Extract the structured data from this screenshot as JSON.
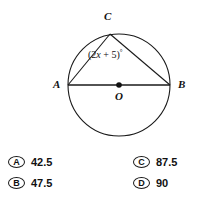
{
  "figure": {
    "type": "circle-geometry-diagram",
    "shape": "circle with inscribed triangle",
    "circle": {
      "center_label": "O",
      "center_x": 119,
      "center_y": 85,
      "radius": 51
    },
    "points": [
      {
        "name": "C",
        "label": "C",
        "x": 110,
        "y": 34,
        "position": "top"
      },
      {
        "name": "A",
        "label": "A",
        "x": 68,
        "y": 85,
        "position": "left"
      },
      {
        "name": "B",
        "label": "B",
        "x": 170,
        "y": 85,
        "position": "right"
      },
      {
        "name": "O",
        "label": "O",
        "x": 119,
        "y": 85,
        "position": "center"
      }
    ],
    "segments": [
      {
        "from": "A",
        "to": "B",
        "description": "diameter"
      },
      {
        "from": "A",
        "to": "C",
        "description": "chord"
      },
      {
        "from": "C",
        "to": "B",
        "description": "chord"
      }
    ],
    "angle_label": {
      "text": "(2x + 5)°",
      "prefix": "(2",
      "variable": "x",
      "middle": " + 5)",
      "degree_symbol": "°",
      "at_vertex": "C",
      "describes": "angle ACB"
    },
    "stroke_color": "#1a1a1a",
    "fill_color": "#ffffff"
  },
  "options": [
    {
      "letter": "A",
      "value": "42.5"
    },
    {
      "letter": "B",
      "value": "47.5"
    },
    {
      "letter": "C",
      "value": "87.5"
    },
    {
      "letter": "D",
      "value": "90"
    }
  ]
}
